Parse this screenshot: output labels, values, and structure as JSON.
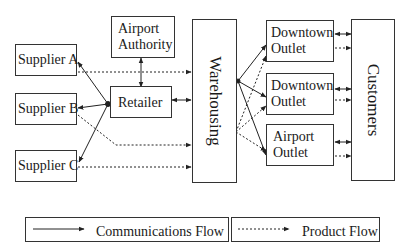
{
  "diagram": {
    "nodes": {
      "supplier_a": "Supplier A",
      "supplier_b": "Supplier B",
      "supplier_c": "Supplier C",
      "airport_authority": "Airport\nAuthority",
      "retailer": "Retailer",
      "warehousing": "Warehousing",
      "downtown_outlet_1": "Downtown\nOutlet",
      "downtown_outlet_2": "Downtown\nOutlet",
      "airport_outlet": "Airport\nOutlet",
      "customers": "Customers"
    },
    "edges": [
      {
        "from": "Retailer",
        "to": "Supplier A",
        "type": "communications"
      },
      {
        "from": "Retailer",
        "to": "Supplier B",
        "type": "communications"
      },
      {
        "from": "Retailer",
        "to": "Supplier C",
        "type": "communications"
      },
      {
        "from": "Retailer",
        "to": "Airport Authority",
        "type": "communications",
        "bidirectional": true
      },
      {
        "from": "Retailer",
        "to": "Warehousing",
        "type": "communications",
        "bidirectional": true
      },
      {
        "from": "Supplier A",
        "to": "Warehousing",
        "type": "product"
      },
      {
        "from": "Supplier B",
        "to": "Warehousing",
        "type": "product"
      },
      {
        "from": "Supplier C",
        "to": "Warehousing",
        "type": "product"
      },
      {
        "from": "Warehousing",
        "to": "Downtown Outlet 1",
        "type": "communications"
      },
      {
        "from": "Warehousing",
        "to": "Downtown Outlet 2",
        "type": "communications"
      },
      {
        "from": "Warehousing",
        "to": "Airport Outlet",
        "type": "communications"
      },
      {
        "from": "Warehousing",
        "to": "Downtown Outlet 1",
        "type": "product"
      },
      {
        "from": "Warehousing",
        "to": "Downtown Outlet 2",
        "type": "product"
      },
      {
        "from": "Warehousing",
        "to": "Airport Outlet",
        "type": "product"
      },
      {
        "from": "Downtown Outlet 1",
        "to": "Customers",
        "type": "communications",
        "bidirectional": true
      },
      {
        "from": "Downtown Outlet 1",
        "to": "Customers",
        "type": "product"
      },
      {
        "from": "Downtown Outlet 2",
        "to": "Customers",
        "type": "communications",
        "bidirectional": true
      },
      {
        "from": "Downtown Outlet 2",
        "to": "Customers",
        "type": "product"
      },
      {
        "from": "Airport Outlet",
        "to": "Customers",
        "type": "communications",
        "bidirectional": true
      },
      {
        "from": "Airport Outlet",
        "to": "Customers",
        "type": "product"
      }
    ]
  },
  "legend": {
    "communications": "Communications Flow",
    "product": "Product Flow"
  }
}
